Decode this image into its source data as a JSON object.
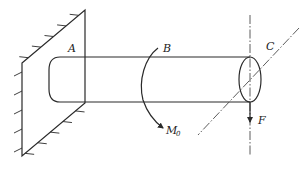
{
  "figure": {
    "labels": {
      "point_a": "A",
      "point_b": "B",
      "point_c": "C",
      "moment": "M",
      "moment_subscript": "0",
      "force": "F"
    },
    "colors": {
      "line": "#2a2a2a",
      "centerline": "#4a4a4a",
      "background": "#ffffff"
    }
  }
}
